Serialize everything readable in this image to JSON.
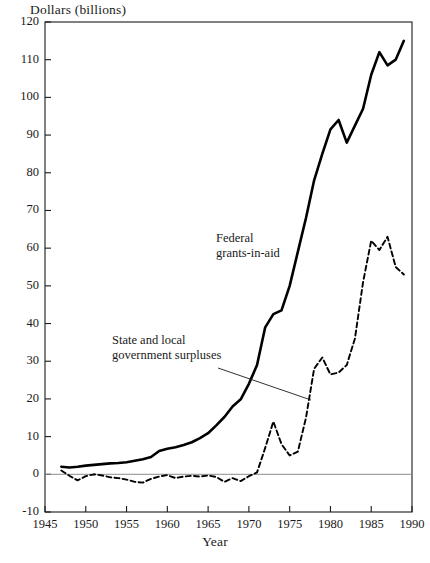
{
  "chart_data": {
    "type": "line",
    "title": "",
    "ylabel": "Dollars (billions)",
    "xlabel": "Year",
    "xlim": [
      1945,
      1990
    ],
    "ylim": [
      -10,
      120
    ],
    "xticks": [
      1945,
      1950,
      1955,
      1960,
      1965,
      1970,
      1975,
      1980,
      1985,
      1990
    ],
    "yticks": [
      -10,
      0,
      10,
      20,
      30,
      40,
      50,
      60,
      70,
      80,
      90,
      100,
      110,
      120
    ],
    "grid": false,
    "legend": "annotations-inline",
    "zero_line": true,
    "series": [
      {
        "name": "Federal grants-in-aid",
        "style": "solid",
        "color": "#000000",
        "x": [
          1947,
          1948,
          1949,
          1950,
          1951,
          1952,
          1953,
          1954,
          1955,
          1956,
          1957,
          1958,
          1959,
          1960,
          1961,
          1962,
          1963,
          1964,
          1965,
          1966,
          1967,
          1968,
          1969,
          1970,
          1971,
          1972,
          1973,
          1974,
          1975,
          1976,
          1977,
          1978,
          1979,
          1980,
          1981,
          1982,
          1983,
          1984,
          1985,
          1986,
          1987,
          1988,
          1989
        ],
        "values": [
          2.0,
          1.8,
          2.0,
          2.3,
          2.5,
          2.7,
          2.9,
          3.0,
          3.2,
          3.6,
          4.0,
          4.6,
          6.2,
          6.8,
          7.2,
          7.8,
          8.5,
          9.6,
          10.9,
          13.0,
          15.2,
          18.0,
          19.9,
          24.0,
          29.0,
          39.0,
          42.5,
          43.5,
          50.0,
          59.0,
          68.0,
          78.0,
          85.0,
          91.5,
          94.0,
          88.0,
          92.5,
          97.0,
          106.0,
          112.0,
          108.5,
          110.0,
          115.0
        ]
      },
      {
        "name": "State and local government surpluses",
        "style": "dashed",
        "color": "#000000",
        "x": [
          1947,
          1948,
          1949,
          1950,
          1951,
          1952,
          1953,
          1954,
          1955,
          1956,
          1957,
          1958,
          1959,
          1960,
          1961,
          1962,
          1963,
          1964,
          1965,
          1966,
          1967,
          1968,
          1969,
          1970,
          1971,
          1972,
          1973,
          1974,
          1975,
          1976,
          1977,
          1978,
          1979,
          1980,
          1981,
          1982,
          1983,
          1984,
          1985,
          1986,
          1987,
          1988,
          1989
        ],
        "values": [
          1.0,
          -0.4,
          -1.6,
          -0.5,
          0.0,
          -0.3,
          -0.8,
          -1.0,
          -1.4,
          -2.0,
          -2.2,
          -1.2,
          -0.6,
          -0.2,
          -1.0,
          -0.6,
          -0.4,
          -0.6,
          -0.3,
          -0.7,
          -2.0,
          -1.0,
          -1.8,
          -0.5,
          0.5,
          7.0,
          14.0,
          8.0,
          5.0,
          6.0,
          15.0,
          28.0,
          31.0,
          26.5,
          27.0,
          29.0,
          36.0,
          51.0,
          62.0,
          59.5,
          63.0,
          55.0,
          53.0
        ]
      }
    ],
    "annotations": [
      {
        "name": "federal-grants-label",
        "text_lines": [
          "Federal",
          "grants-in-aid"
        ],
        "x_px": 216,
        "y_px": 231
      },
      {
        "name": "state-local-label",
        "text_lines": [
          "State and local",
          "government surpluses"
        ],
        "x_px": 112,
        "y_px": 333,
        "leader_line": {
          "x1": 218,
          "y1": 368,
          "x2": 311,
          "y2": 400
        }
      }
    ]
  },
  "labels": {
    "y_axis_title": "Dollars (billions)",
    "x_axis_title": "Year",
    "ytick_texts": [
      "120",
      "110",
      "100",
      "90",
      "80",
      "70",
      "60",
      "50",
      "40",
      "30",
      "20",
      "10",
      "0",
      "-10"
    ],
    "xtick_texts": [
      "1945",
      "1950",
      "1955",
      "1960",
      "1965",
      "1970",
      "1975",
      "1980",
      "1985",
      "1990"
    ],
    "ann_federal_line1": "Federal",
    "ann_federal_line2": "grants-in-aid",
    "ann_state_line1": "State and local",
    "ann_state_line2": "government surpluses"
  },
  "colors": {
    "axis": "#1a1a1a",
    "series_solid": "#000000",
    "series_dashed": "#000000",
    "zero_line": "#8c8c8c",
    "background": "#ffffff"
  },
  "geometry": {
    "plot_left_px": 45,
    "plot_right_px": 412,
    "plot_top_px": 22,
    "plot_bottom_px": 512
  }
}
